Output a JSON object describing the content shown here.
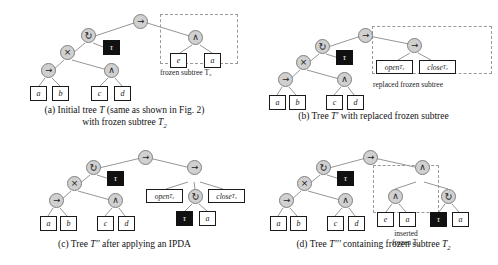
{
  "figure": {
    "symbols": {
      "sequence": "→",
      "loop": "↻",
      "xor": "×",
      "and": "∧",
      "tau": "τ"
    },
    "panels": [
      {
        "id": "a",
        "caption_line1": "(a) Initial tree T (same as shown in Fig. 2)",
        "caption_line2": "with frozen subtree T₂",
        "caption_letter": "(a)",
        "caption_text": "Initial tree T (same as shown in Fig. 2) with frozen subtree T2",
        "annotation": "frozen subtree T₂",
        "nodes": [
          {
            "name": "root-sequence",
            "label": "→"
          },
          {
            "name": "loop",
            "label": "↻"
          },
          {
            "name": "xor",
            "label": "×"
          },
          {
            "name": "seq-inner",
            "label": "→"
          },
          {
            "name": "and-inner",
            "label": "∧"
          },
          {
            "name": "and-frozen",
            "label": "∧"
          }
        ],
        "leaves": [
          "a",
          "b",
          "c",
          "d",
          "τ",
          "e",
          "a"
        ]
      },
      {
        "id": "b",
        "caption_letter": "(b)",
        "caption_text": "Tree T′ with replaced frozen subtree",
        "annotation": "replaced frozen subtree",
        "open_label": "open",
        "open_sup": "T₂",
        "close_label": "close",
        "close_sup": "T₂",
        "leaves": [
          "a",
          "b",
          "c",
          "d",
          "τ"
        ]
      },
      {
        "id": "c",
        "caption_letter": "(c)",
        "caption_text": "Tree T″ after applying an IPDA",
        "open_label": "open",
        "open_sup": "T₂",
        "close_label": "close",
        "close_sup": "T₂",
        "leaves": [
          "a",
          "b",
          "c",
          "d",
          "τ",
          "τ",
          "a"
        ]
      },
      {
        "id": "d",
        "caption_letter": "(d)",
        "caption_text": "Tree T‴ containing frozen subtree T₂",
        "annotation_line1": "inserted",
        "annotation_line2": "frozen T₂",
        "leaves": [
          "a",
          "b",
          "c",
          "d",
          "τ",
          "e",
          "a",
          "τ",
          "a"
        ]
      }
    ]
  },
  "colors": {
    "node_fill": "#d0d0d0",
    "node_border": "#808080",
    "leaf_fill": "#ffffff",
    "leaf_border": "#1a1a1a",
    "tau_fill": "#111111",
    "tau_text": "#ffffff",
    "edge": "#808080",
    "frozen_dash": "#9a9a9a",
    "text": "#1a1a1a",
    "background": "#ffffff"
  }
}
